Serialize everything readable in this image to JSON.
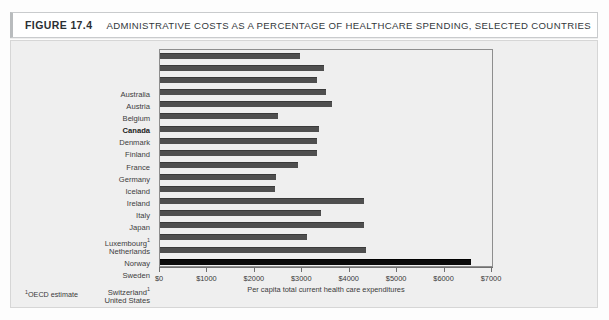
{
  "header": {
    "figure_number": "FIGURE 17.4",
    "title": "ADMINISTRATIVE COSTS AS A PERCENTAGE OF HEALTHCARE SPENDING, SELECTED COUNTRIES"
  },
  "footnote": {
    "marker": "1",
    "text": "OECD estimate"
  },
  "chart_data": {
    "type": "bar",
    "orientation": "horizontal",
    "title": "ADMINISTRATIVE COSTS AS A PERCENTAGE OF HEALTHCARE SPENDING, SELECTED COUNTRIES",
    "xlabel": "Per capita total current health care expenditures",
    "ylabel": "",
    "xlim": [
      0,
      7000
    ],
    "xticks": [
      0,
      1000,
      2000,
      3000,
      4000,
      5000,
      6000,
      7000
    ],
    "xticklabels": [
      "$0",
      "$1000",
      "$2000",
      "$3000",
      "$4000",
      "$5000",
      "$6000",
      "$7000"
    ],
    "grid": false,
    "legend": null,
    "bar_color": "#4f4f4f",
    "highlight_color": "#0a0a0a",
    "categories": [
      "Australia",
      "Austria",
      "Belgium",
      "Canada",
      "Denmark",
      "Finland",
      "France",
      "Germany",
      "Iceland",
      "Ireland",
      "Italy",
      "Japan",
      "Luxembourg",
      "Netherlands",
      "Norway",
      "Sweden",
      "Switzerland",
      "United States"
    ],
    "values": [
      2950,
      3450,
      3300,
      3500,
      3620,
      2480,
      3350,
      3300,
      3300,
      2900,
      2450,
      2420,
      4300,
      3400,
      4300,
      3100,
      4350,
      6550
    ],
    "bars": [
      {
        "label": "Australia",
        "value": 2950,
        "bold": false,
        "footnote": false,
        "highlight": false
      },
      {
        "label": "Austria",
        "value": 3450,
        "bold": false,
        "footnote": false,
        "highlight": false
      },
      {
        "label": "Belgium",
        "value": 3300,
        "bold": false,
        "footnote": false,
        "highlight": false
      },
      {
        "label": "Canada",
        "value": 3500,
        "bold": true,
        "footnote": false,
        "highlight": false
      },
      {
        "label": "Denmark",
        "value": 3620,
        "bold": false,
        "footnote": false,
        "highlight": false
      },
      {
        "label": "Finland",
        "value": 2480,
        "bold": false,
        "footnote": false,
        "highlight": false
      },
      {
        "label": "France",
        "value": 3350,
        "bold": false,
        "footnote": false,
        "highlight": false
      },
      {
        "label": "Germany",
        "value": 3300,
        "bold": false,
        "footnote": false,
        "highlight": false
      },
      {
        "label": "Iceland",
        "value": 3300,
        "bold": false,
        "footnote": false,
        "highlight": false
      },
      {
        "label": "Ireland",
        "value": 2900,
        "bold": false,
        "footnote": false,
        "highlight": false
      },
      {
        "label": "Italy",
        "value": 2450,
        "bold": false,
        "footnote": false,
        "highlight": false
      },
      {
        "label": "Japan",
        "value": 2420,
        "bold": false,
        "footnote": false,
        "highlight": false
      },
      {
        "label": "Luxembourg",
        "value": 4300,
        "bold": false,
        "footnote": true,
        "highlight": false
      },
      {
        "label": "Netherlands",
        "value": 3400,
        "bold": false,
        "footnote": false,
        "highlight": false
      },
      {
        "label": "Norway",
        "value": 4300,
        "bold": false,
        "footnote": false,
        "highlight": false
      },
      {
        "label": "Sweden",
        "value": 3100,
        "bold": false,
        "footnote": false,
        "highlight": false
      },
      {
        "label": "Switzerland",
        "value": 4350,
        "bold": false,
        "footnote": true,
        "highlight": false
      },
      {
        "label": "United States",
        "value": 6550,
        "bold": false,
        "footnote": false,
        "highlight": true
      }
    ]
  }
}
